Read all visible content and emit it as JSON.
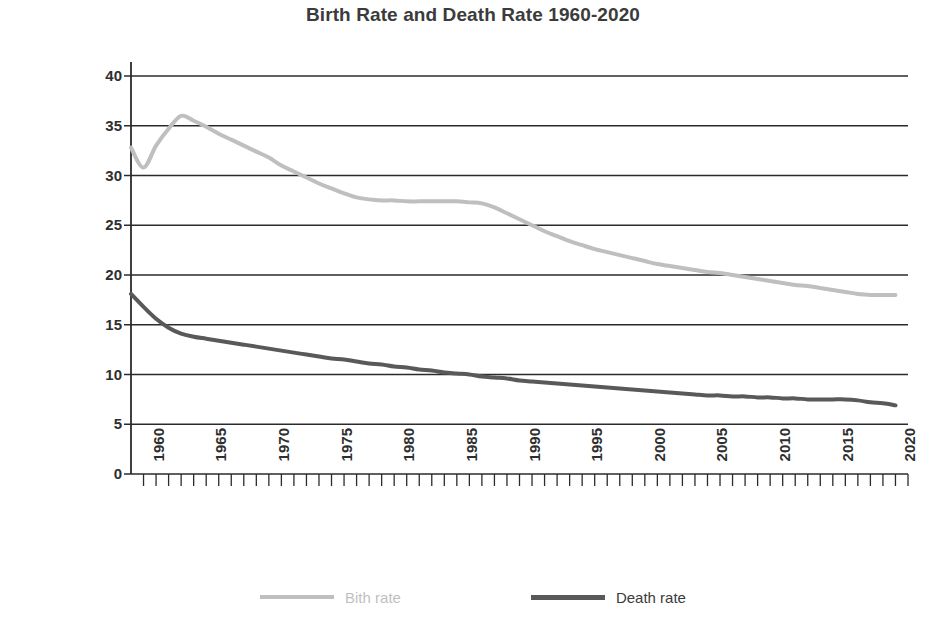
{
  "chart_data": {
    "type": "line",
    "title": "Birth Rate and Death Rate 1960-2020",
    "xlabel": "",
    "ylabel": "Number per 1,000 People",
    "xlim": [
      1959,
      2021
    ],
    "ylim": [
      0,
      40
    ],
    "ytick_step": 5,
    "yticks": [
      0,
      5,
      10,
      15,
      20,
      25,
      30,
      35,
      40
    ],
    "ytick_labels": [
      "0",
      "5",
      "10",
      "15",
      "20",
      "25",
      "30",
      "35",
      "40"
    ],
    "xticks": [
      1960,
      1965,
      1970,
      1975,
      1980,
      1985,
      1990,
      1995,
      2000,
      2005,
      2010,
      2015,
      2020
    ],
    "xtick_labels": [
      "1960",
      "1965",
      "1970",
      "1975",
      "1980",
      "1985",
      "1990",
      "1995",
      "2000",
      "2005",
      "2010",
      "2015",
      "2020"
    ],
    "xtick_minor_step": 1,
    "grid": "horizontal",
    "legend_position": "bottom",
    "series": [
      {
        "name": "Bith rate",
        "color": "#bfbfbf",
        "width": 4,
        "x": [
          1959,
          1960,
          1961,
          1962,
          1963,
          1964,
          1965,
          1966,
          1967,
          1968,
          1969,
          1970,
          1971,
          1972,
          1973,
          1974,
          1975,
          1976,
          1977,
          1978,
          1979,
          1980,
          1981,
          1982,
          1983,
          1984,
          1985,
          1986,
          1987,
          1988,
          1989,
          1990,
          1991,
          1992,
          1993,
          1994,
          1995,
          1996,
          1997,
          1998,
          1999,
          2000,
          2001,
          2002,
          2003,
          2004,
          2005,
          2006,
          2007,
          2008,
          2009,
          2010,
          2011,
          2012,
          2013,
          2014,
          2015,
          2016,
          2017,
          2018,
          2019,
          2020
        ],
        "values": [
          32.8,
          30.8,
          33.0,
          34.7,
          36.0,
          35.5,
          34.9,
          34.2,
          33.6,
          33.0,
          32.4,
          31.8,
          31.0,
          30.4,
          29.8,
          29.2,
          28.7,
          28.2,
          27.8,
          27.6,
          27.5,
          27.5,
          27.4,
          27.4,
          27.4,
          27.4,
          27.4,
          27.3,
          27.2,
          26.8,
          26.2,
          25.6,
          25.0,
          24.4,
          23.9,
          23.4,
          23.0,
          22.6,
          22.3,
          22.0,
          21.7,
          21.4,
          21.1,
          20.9,
          20.7,
          20.5,
          20.3,
          20.2,
          20.0,
          19.8,
          19.6,
          19.4,
          19.2,
          19.0,
          18.9,
          18.7,
          18.5,
          18.3,
          18.1,
          18.0,
          18.0,
          18.0
        ]
      },
      {
        "name": "Death rate",
        "color": "#595959",
        "width": 4,
        "x": [
          1959,
          1960,
          1961,
          1962,
          1963,
          1964,
          1965,
          1966,
          1967,
          1968,
          1969,
          1970,
          1971,
          1972,
          1973,
          1974,
          1975,
          1976,
          1977,
          1978,
          1979,
          1980,
          1981,
          1982,
          1983,
          1984,
          1985,
          1986,
          1987,
          1988,
          1989,
          1990,
          1991,
          1992,
          1993,
          1994,
          1995,
          1996,
          1997,
          1998,
          1999,
          2000,
          2001,
          2002,
          2003,
          2004,
          2005,
          2006,
          2007,
          2008,
          2009,
          2010,
          2011,
          2012,
          2013,
          2014,
          2015,
          2016,
          2017,
          2018,
          2019,
          2020
        ],
        "values": [
          18.1,
          16.8,
          15.6,
          14.7,
          14.1,
          13.8,
          13.6,
          13.4,
          13.2,
          13.0,
          12.8,
          12.6,
          12.4,
          12.2,
          12.0,
          11.8,
          11.6,
          11.5,
          11.3,
          11.1,
          11.0,
          10.8,
          10.7,
          10.5,
          10.4,
          10.2,
          10.1,
          10.0,
          9.8,
          9.7,
          9.6,
          9.4,
          9.3,
          9.2,
          9.1,
          9.0,
          8.9,
          8.8,
          8.7,
          8.6,
          8.5,
          8.4,
          8.3,
          8.2,
          8.1,
          8.0,
          7.9,
          7.9,
          7.8,
          7.8,
          7.7,
          7.7,
          7.6,
          7.6,
          7.5,
          7.5,
          7.5,
          7.5,
          7.4,
          7.2,
          7.1,
          6.9
        ]
      }
    ]
  },
  "legend": {
    "items": [
      {
        "label": "Bith rate",
        "color": "#bfbfbf"
      },
      {
        "label": "Death rate",
        "color": "#595959"
      }
    ]
  }
}
